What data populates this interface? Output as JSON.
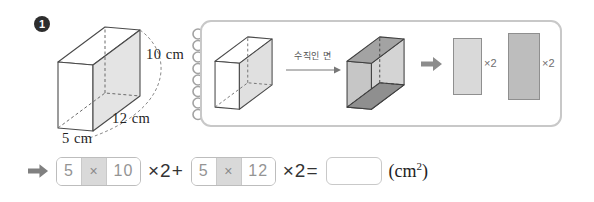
{
  "problem_number": "1",
  "solid": {
    "height_label": "10 cm",
    "length_label": "12 cm",
    "width_label": "5 cm"
  },
  "panel": {
    "arrow_label": "수직인 면",
    "rect1_multiplier": "×2",
    "rect2_multiplier": "×2"
  },
  "equation": {
    "group1": {
      "left": "5",
      "op": "×",
      "right": "10"
    },
    "after_group1": "×2+",
    "group2": {
      "left": "5",
      "op": "×",
      "right": "12"
    },
    "after_group2": "×2=",
    "answer_value": "",
    "unit_open": "(cm",
    "unit_sup": "2",
    "unit_close": ")"
  },
  "colors": {
    "badge": "#2d2d2d",
    "panel_border": "#c8c8c8",
    "prism_line": "#4a4a4a",
    "shaded_face_light": "#e4e4e4",
    "shaded_face_top_dark": "#a3a3a3",
    "shaded_face_front": "#c6c6c6",
    "shaded_face_right": "#d4d4d4",
    "shaded_face_bottom_dark": "#8f8f8f",
    "rect1_fill": "#d9d9d9",
    "rect2_fill": "#bdbdbd",
    "arrow_gray": "#8c8c8c",
    "operator_cell_bg": "#d9d9d9"
  }
}
